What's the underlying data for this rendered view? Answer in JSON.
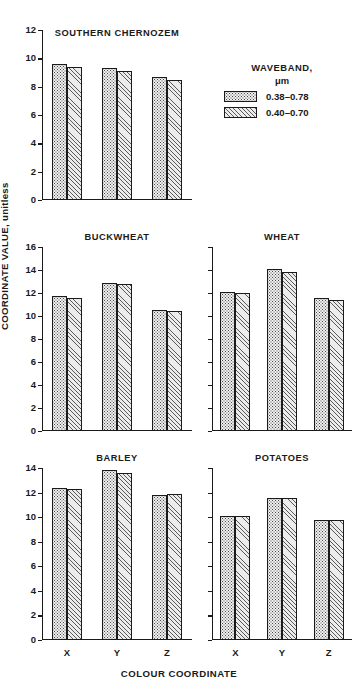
{
  "chart_data": {
    "type": "bar",
    "title": "",
    "xlabel": "COLOUR COORDINATE",
    "ylabel": "COORDINATE VALUE, unitless",
    "categories": [
      "X",
      "Y",
      "Z"
    ],
    "legend": {
      "title": "WAVEBAND,",
      "unit": "μm",
      "position": "top-right",
      "entries": [
        {
          "label": "0.38–0.78",
          "pattern": "dotted"
        },
        {
          "label": "0.40–0.70",
          "pattern": "diagonal-hatch"
        }
      ]
    },
    "grid": false,
    "panels": [
      {
        "title": "SOUTHERN CHERNOZEM",
        "ylim": [
          0,
          12
        ],
        "yticks": [
          0,
          2,
          4,
          6,
          8,
          10,
          12
        ],
        "ytick_labels": [
          "0",
          "2",
          "4",
          "6",
          "8",
          "10",
          "12"
        ],
        "show_ytick_labels": true,
        "show_xtick_labels": false,
        "series": [
          {
            "name": "0.38–0.78",
            "values": [
              9.6,
              9.3,
              8.7
            ]
          },
          {
            "name": "0.40–0.70",
            "values": [
              9.4,
              9.1,
              8.5
            ]
          }
        ]
      },
      {
        "title": "BUCKWHEAT",
        "ylim": [
          0,
          16
        ],
        "yticks": [
          0,
          2,
          4,
          6,
          8,
          10,
          12,
          14,
          16
        ],
        "ytick_labels": [
          "0",
          "2",
          "4",
          "6",
          "8",
          "10",
          "12",
          "14",
          "16"
        ],
        "show_ytick_labels": true,
        "show_xtick_labels": false,
        "series": [
          {
            "name": "0.38–0.78",
            "values": [
              11.7,
              12.9,
              10.5
            ]
          },
          {
            "name": "0.40–0.70",
            "values": [
              11.6,
              12.8,
              10.4
            ]
          }
        ]
      },
      {
        "title": "WHEAT",
        "ylim": [
          0,
          16
        ],
        "yticks": [
          0,
          2,
          4,
          6,
          8,
          10,
          12,
          14,
          16
        ],
        "ytick_labels": [
          "",
          "",
          "",
          "",
          "",
          "",
          "",
          "",
          ""
        ],
        "show_ytick_labels": false,
        "show_xtick_labels": false,
        "series": [
          {
            "name": "0.38–0.78",
            "values": [
              12.1,
              14.1,
              11.6
            ]
          },
          {
            "name": "0.40–0.70",
            "values": [
              12.0,
              13.8,
              11.4
            ]
          }
        ]
      },
      {
        "title": "BARLEY",
        "ylim": [
          0,
          14
        ],
        "yticks": [
          0,
          2,
          4,
          6,
          8,
          10,
          12,
          14
        ],
        "ytick_labels": [
          "0",
          "2",
          "4",
          "6",
          "8",
          "10",
          "12",
          "14"
        ],
        "show_ytick_labels": true,
        "show_xtick_labels": true,
        "series": [
          {
            "name": "0.38–0.78",
            "values": [
              12.4,
              13.8,
              11.8
            ]
          },
          {
            "name": "0.40–0.70",
            "values": [
              12.3,
              13.6,
              11.9
            ]
          }
        ]
      },
      {
        "title": "POTATOES",
        "ylim": [
          0,
          14
        ],
        "yticks": [
          0,
          2,
          4,
          6,
          8,
          10,
          12,
          14
        ],
        "ytick_labels": [
          "",
          "",
          "",
          "",
          "",
          "",
          "",
          ""
        ],
        "show_ytick_labels": false,
        "show_xtick_labels": true,
        "series": [
          {
            "name": "0.38–0.78",
            "values": [
              10.1,
              11.6,
              9.8
            ]
          },
          {
            "name": "0.40–0.70",
            "values": [
              10.1,
              11.6,
              9.8
            ]
          }
        ]
      }
    ]
  },
  "style": {
    "bar_dotted_fill": "#efefef",
    "bar_hatch_fill": "#ececec",
    "line_color": "#1a1a1a",
    "background": "#ffffff"
  }
}
